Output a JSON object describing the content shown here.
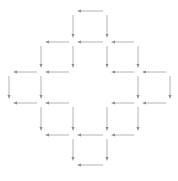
{
  "diagram": {
    "colors": {
      "line": "#b4b4b4",
      "arrowhead": "#8c8c8c",
      "background": "#ffffff"
    },
    "columns_x": [
      9,
      41,
      73,
      107,
      138,
      170
    ],
    "rows_y": [
      11,
      42,
      72,
      103,
      135,
      165
    ],
    "horizontal_arrows": [
      {
        "row": 0,
        "from_col": 3,
        "to_col": 2
      },
      {
        "row": 1,
        "from_col": 2,
        "to_col": 1
      },
      {
        "row": 1,
        "from_col": 3,
        "to_col": 2
      },
      {
        "row": 1,
        "from_col": 4,
        "to_col": 3
      },
      {
        "row": 2,
        "from_col": 1,
        "to_col": 0
      },
      {
        "row": 2,
        "from_col": 2,
        "to_col": 1
      },
      {
        "row": 2,
        "from_col": 4,
        "to_col": 3
      },
      {
        "row": 2,
        "from_col": 5,
        "to_col": 4
      },
      {
        "row": 3,
        "from_col": 1,
        "to_col": 0
      },
      {
        "row": 3,
        "from_col": 2,
        "to_col": 1
      },
      {
        "row": 3,
        "from_col": 4,
        "to_col": 3
      },
      {
        "row": 3,
        "from_col": 5,
        "to_col": 4
      },
      {
        "row": 4,
        "from_col": 2,
        "to_col": 1
      },
      {
        "row": 4,
        "from_col": 3,
        "to_col": 2
      },
      {
        "row": 4,
        "from_col": 4,
        "to_col": 3
      },
      {
        "row": 5,
        "from_col": 3,
        "to_col": 2
      }
    ],
    "vertical_arrows": [
      {
        "col": 2,
        "from_row": 0,
        "to_row": 1
      },
      {
        "col": 3,
        "from_row": 0,
        "to_row": 1
      },
      {
        "col": 1,
        "from_row": 1,
        "to_row": 2
      },
      {
        "col": 2,
        "from_row": 1,
        "to_row": 2
      },
      {
        "col": 3,
        "from_row": 1,
        "to_row": 2
      },
      {
        "col": 4,
        "from_row": 1,
        "to_row": 2
      },
      {
        "col": 0,
        "from_row": 2,
        "to_row": 3
      },
      {
        "col": 1,
        "from_row": 2,
        "to_row": 3
      },
      {
        "col": 4,
        "from_row": 2,
        "to_row": 3
      },
      {
        "col": 5,
        "from_row": 2,
        "to_row": 3
      },
      {
        "col": 1,
        "from_row": 3,
        "to_row": 4
      },
      {
        "col": 2,
        "from_row": 3,
        "to_row": 4
      },
      {
        "col": 3,
        "from_row": 3,
        "to_row": 4
      },
      {
        "col": 4,
        "from_row": 3,
        "to_row": 4
      },
      {
        "col": 2,
        "from_row": 4,
        "to_row": 5
      },
      {
        "col": 3,
        "from_row": 4,
        "to_row": 5
      }
    ]
  }
}
